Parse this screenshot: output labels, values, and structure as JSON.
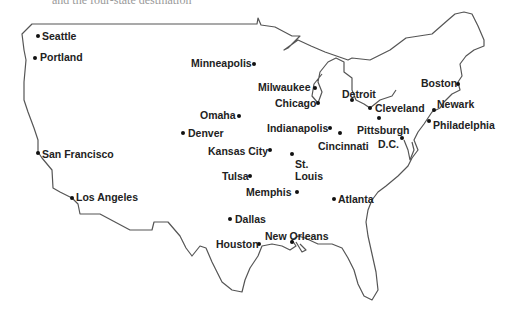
{
  "caption": "and the four-state destination",
  "map": {
    "type": "outline-map",
    "region": "United States (contiguous)",
    "outline_color": "#555555",
    "label_color": "#222222",
    "dot_color": "#111111"
  },
  "cities": [
    {
      "name": "Seattle",
      "dot": [
        38,
        36
      ],
      "label": [
        42,
        30
      ]
    },
    {
      "name": "Portland",
      "dot": [
        35,
        58
      ],
      "label": [
        40,
        51
      ]
    },
    {
      "name": "Minneapolis",
      "dot": [
        254,
        64
      ],
      "label": [
        191,
        57
      ]
    },
    {
      "name": "Milwaukee",
      "dot": [
        315,
        88
      ],
      "label": [
        258,
        81
      ]
    },
    {
      "name": "Chicago",
      "dot": [
        318,
        103
      ],
      "label": [
        275,
        97
      ]
    },
    {
      "name": "Detroit",
      "dot": [
        352,
        100
      ],
      "label": [
        342,
        88
      ]
    },
    {
      "name": "Cleveland",
      "dot": [
        370,
        108
      ],
      "label": [
        375,
        102
      ]
    },
    {
      "name": "Boston",
      "dot": [
        458,
        84
      ],
      "label": [
        421,
        77
      ]
    },
    {
      "name": "Newark",
      "dot": [
        434,
        110
      ],
      "label": [
        437,
        98
      ]
    },
    {
      "name": "Philadelphia",
      "dot": [
        429,
        121
      ],
      "label": [
        433,
        119
      ]
    },
    {
      "name": "Pittsburgh",
      "dot": [
        379,
        118
      ],
      "label": [
        357,
        124
      ]
    },
    {
      "name": "D.C.",
      "dot": [
        402,
        138
      ],
      "label": [
        378,
        138
      ]
    },
    {
      "name": "Omaha",
      "dot": [
        239,
        116
      ],
      "label": [
        200,
        109
      ]
    },
    {
      "name": "Denver",
      "dot": [
        183,
        133
      ],
      "label": [
        188,
        127
      ]
    },
    {
      "name": "Indianapolis",
      "dot": [
        330,
        128
      ],
      "label": [
        267,
        122
      ]
    },
    {
      "name": "Cincinnati",
      "dot": [
        340,
        133
      ],
      "label": [
        318,
        140
      ]
    },
    {
      "name": "Kansas City",
      "dot": [
        270,
        150
      ],
      "label": [
        208,
        145
      ]
    },
    {
      "name": "St. Louis",
      "dot": [
        292,
        154
      ],
      "label": [
        295,
        158
      ],
      "multiline": true
    },
    {
      "name": "San Francisco",
      "dot": [
        38,
        153
      ],
      "label": [
        42,
        148
      ]
    },
    {
      "name": "Tulsa",
      "dot": [
        250,
        176
      ],
      "label": [
        222,
        170
      ]
    },
    {
      "name": "Memphis",
      "dot": [
        297,
        192
      ],
      "label": [
        246,
        186
      ]
    },
    {
      "name": "Atlanta",
      "dot": [
        334,
        199
      ],
      "label": [
        338,
        193
      ]
    },
    {
      "name": "Los Angeles",
      "dot": [
        72,
        198
      ],
      "label": [
        76,
        191
      ]
    },
    {
      "name": "Dallas",
      "dot": [
        230,
        219
      ],
      "label": [
        235,
        213
      ]
    },
    {
      "name": "Houston",
      "dot": [
        259,
        244
      ],
      "label": [
        216,
        238
      ]
    },
    {
      "name": "New Orleans",
      "dot": [
        292,
        242
      ],
      "label": [
        265,
        230
      ]
    }
  ]
}
